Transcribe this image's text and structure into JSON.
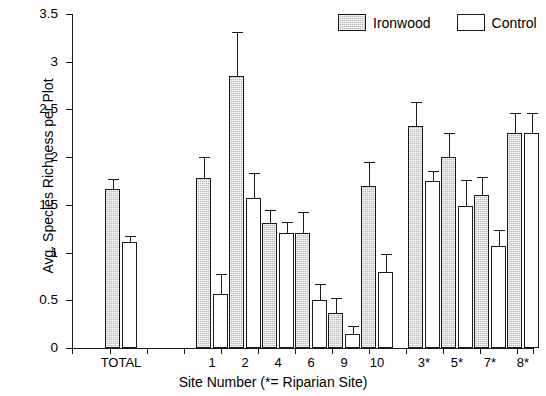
{
  "chart_data": {
    "type": "bar",
    "title": "",
    "xlabel": "Site Number (*= Riparian Site)",
    "ylabel": "Avg. Species Richness per Plot",
    "ylim": [
      0,
      3.5
    ],
    "ytick_labels": [
      "0",
      "0.5",
      "1",
      "1.5",
      "2",
      "2.5",
      "3",
      "3.5"
    ],
    "ytick_values": [
      0,
      0.5,
      1,
      1.5,
      2,
      2.5,
      3,
      3.5
    ],
    "grid": false,
    "legend_position": "top-right",
    "categories": [
      "TOTAL",
      "1",
      "2",
      "4",
      "6",
      "9",
      "10",
      "3*",
      "5*",
      "7*",
      "8*"
    ],
    "series": [
      {
        "name": "Ironwood",
        "color": "#b9b9b9",
        "values": [
          1.67,
          1.78,
          2.85,
          1.31,
          1.21,
          0.37,
          1.7,
          2.33,
          2.0,
          1.6,
          2.25
        ],
        "errors": [
          0.1,
          0.22,
          0.46,
          0.14,
          0.21,
          0.15,
          0.25,
          0.25,
          0.25,
          0.19,
          0.21
        ]
      },
      {
        "name": "Control",
        "color": "#ffffff",
        "values": [
          1.11,
          0.57,
          1.57,
          1.21,
          0.5,
          0.15,
          0.8,
          1.75,
          1.49,
          1.07,
          2.25
        ],
        "errors": [
          0.06,
          0.21,
          0.26,
          0.11,
          0.17,
          0.08,
          0.18,
          0.11,
          0.27,
          0.17,
          0.21
        ]
      }
    ]
  },
  "legend": {
    "items": [
      {
        "label": "Ironwood",
        "swatch": "hatched-gray-swatch"
      },
      {
        "label": "Control",
        "swatch": "white-swatch"
      }
    ]
  }
}
